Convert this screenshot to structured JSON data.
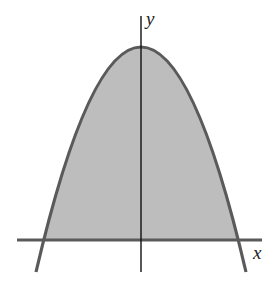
{
  "figure": {
    "labels": {
      "x_axis": "x",
      "y_axis": "y"
    },
    "colors": {
      "fill": "#bdbdbd",
      "curve": "#5a5a5a",
      "x_axis": "#5a5a5a",
      "y_axis": "#111111",
      "background": "#ffffff"
    }
  }
}
